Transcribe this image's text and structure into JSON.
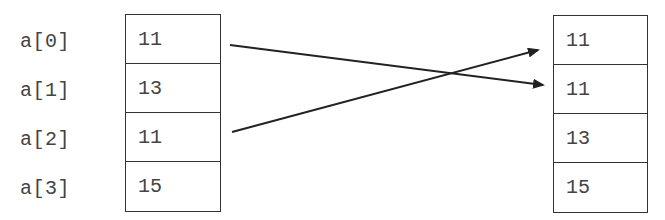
{
  "left_array": {
    "labels": [
      "a[0]",
      "a[1]",
      "a[2]",
      "a[3]"
    ],
    "values": [
      "11",
      "13",
      "11",
      "15"
    ]
  },
  "right_array": {
    "values": [
      "11",
      "11",
      "13",
      "15"
    ]
  },
  "arrows": [
    {
      "from": "a[0]",
      "to_index": 1
    },
    {
      "from": "a[2]",
      "to_index": 0
    }
  ]
}
